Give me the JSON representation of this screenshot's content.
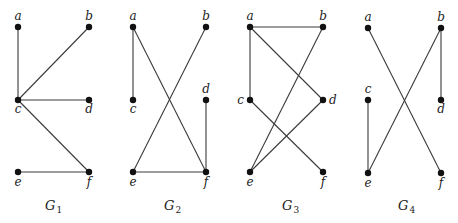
{
  "figure": {
    "graphs": [
      {
        "id": "G1",
        "label_main": "G",
        "label_sub": "1",
        "label_pos": [
          45,
          210
        ],
        "nodes": {
          "a": {
            "x": 18,
            "y": 27,
            "lx": 18,
            "ly": 20,
            "anchor": "middle"
          },
          "b": {
            "x": 89,
            "y": 27,
            "lx": 89,
            "ly": 20,
            "anchor": "middle"
          },
          "c": {
            "x": 18,
            "y": 100,
            "lx": 18,
            "ly": 113,
            "anchor": "middle"
          },
          "d": {
            "x": 89,
            "y": 100,
            "lx": 89,
            "ly": 113,
            "anchor": "middle"
          },
          "e": {
            "x": 18,
            "y": 172,
            "lx": 18,
            "ly": 186,
            "anchor": "middle"
          },
          "f": {
            "x": 89,
            "y": 172,
            "lx": 89,
            "ly": 186,
            "anchor": "middle"
          }
        },
        "edges": [
          [
            "a",
            "c"
          ],
          [
            "b",
            "c"
          ],
          [
            "c",
            "d"
          ],
          [
            "c",
            "f"
          ],
          [
            "e",
            "f"
          ]
        ]
      },
      {
        "id": "G2",
        "label_main": "G",
        "label_sub": "2",
        "label_pos": [
          164,
          210
        ],
        "nodes": {
          "a": {
            "x": 133,
            "y": 27,
            "lx": 133,
            "ly": 20,
            "anchor": "middle"
          },
          "b": {
            "x": 206,
            "y": 27,
            "lx": 206,
            "ly": 20,
            "anchor": "middle"
          },
          "c": {
            "x": 133,
            "y": 100,
            "lx": 133,
            "ly": 113,
            "anchor": "middle"
          },
          "d": {
            "x": 206,
            "y": 100,
            "lx": 206,
            "ly": 93,
            "anchor": "middle"
          },
          "e": {
            "x": 133,
            "y": 172,
            "lx": 133,
            "ly": 186,
            "anchor": "middle"
          },
          "f": {
            "x": 206,
            "y": 172,
            "lx": 206,
            "ly": 186,
            "anchor": "middle"
          }
        },
        "edges": [
          [
            "a",
            "c"
          ],
          [
            "a",
            "f"
          ],
          [
            "b",
            "e"
          ],
          [
            "d",
            "f"
          ],
          [
            "e",
            "f"
          ]
        ]
      },
      {
        "id": "G3",
        "label_main": "G",
        "label_sub": "3",
        "label_pos": [
          282,
          210
        ],
        "nodes": {
          "a": {
            "x": 250,
            "y": 27,
            "lx": 250,
            "ly": 20,
            "anchor": "middle"
          },
          "b": {
            "x": 323,
            "y": 27,
            "lx": 323,
            "ly": 20,
            "anchor": "middle"
          },
          "c": {
            "x": 250,
            "y": 100,
            "lx": 244,
            "ly": 104,
            "anchor": "end"
          },
          "d": {
            "x": 323,
            "y": 100,
            "lx": 329,
            "ly": 104,
            "anchor": "start"
          },
          "e": {
            "x": 250,
            "y": 172,
            "lx": 250,
            "ly": 186,
            "anchor": "middle"
          },
          "f": {
            "x": 323,
            "y": 172,
            "lx": 323,
            "ly": 186,
            "anchor": "middle"
          }
        },
        "edges": [
          [
            "a",
            "b"
          ],
          [
            "a",
            "c"
          ],
          [
            "a",
            "d"
          ],
          [
            "b",
            "e"
          ],
          [
            "c",
            "f"
          ],
          [
            "d",
            "e"
          ]
        ]
      },
      {
        "id": "G4",
        "label_main": "G",
        "label_sub": "4",
        "label_pos": [
          398,
          210
        ],
        "nodes": {
          "a": {
            "x": 368,
            "y": 28,
            "lx": 368,
            "ly": 21,
            "anchor": "middle"
          },
          "b": {
            "x": 441,
            "y": 28,
            "lx": 441,
            "ly": 21,
            "anchor": "middle"
          },
          "c": {
            "x": 368,
            "y": 100,
            "lx": 368,
            "ly": 93,
            "anchor": "middle"
          },
          "d": {
            "x": 441,
            "y": 100,
            "lx": 441,
            "ly": 113,
            "anchor": "middle"
          },
          "e": {
            "x": 368,
            "y": 173,
            "lx": 368,
            "ly": 187,
            "anchor": "middle"
          },
          "f": {
            "x": 441,
            "y": 173,
            "lx": 441,
            "ly": 187,
            "anchor": "middle"
          }
        },
        "edges": [
          [
            "a",
            "f"
          ],
          [
            "b",
            "d"
          ],
          [
            "b",
            "e"
          ],
          [
            "c",
            "e"
          ]
        ]
      }
    ]
  },
  "style": {
    "edge_color": "#3a3a3a",
    "node_color": "#111111",
    "node_radius": 3.2
  }
}
